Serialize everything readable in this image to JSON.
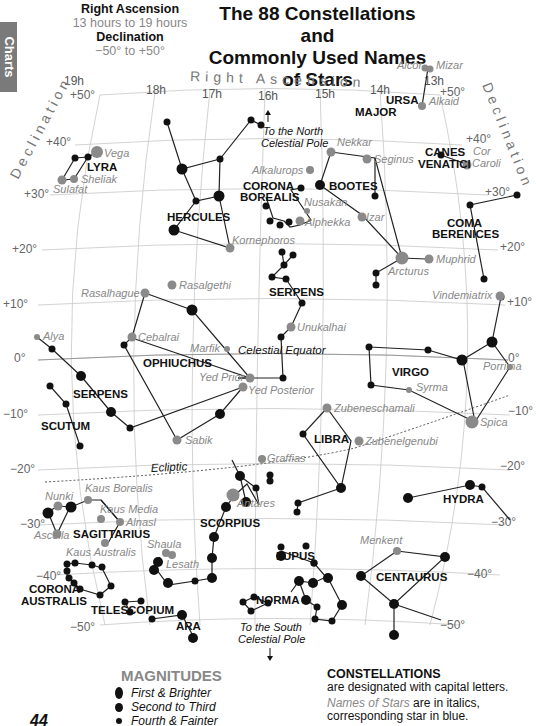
{
  "side_tab": {
    "label": "Charts"
  },
  "header": {
    "ra_title": "Right Ascension",
    "ra_range": "13 hours to 19 hours",
    "dec_title": "Declination",
    "dec_range": "−50° to +50°"
  },
  "title": {
    "line1": "The 88 Constellations and",
    "line2": "Commonly Used Names of Stars"
  },
  "axis": {
    "ra_label": "Right Ascension",
    "dec_label_left": "Declination",
    "dec_label_right": "Declination",
    "ra_ticks": [
      "19h",
      "18h",
      "17h",
      "16h",
      "15h",
      "14h",
      "13h"
    ],
    "dec_ticks_left": [
      "+50°",
      "+40°",
      "+30°",
      "+20°",
      "+10°",
      "0°",
      "−10°",
      "−20°",
      "−30°",
      "−40°",
      "−50°"
    ],
    "dec_ticks_right": [
      "+50°",
      "+40°",
      "+30°",
      "+20°",
      "+10°",
      "0°",
      "−10°",
      "−20°",
      "−30°",
      "−40°",
      "−50°"
    ]
  },
  "annotations": {
    "north_pole_1": "To the North",
    "north_pole_2": "Celestial Pole",
    "south_pole_1": "To the South",
    "south_pole_2": "Celestial Pole",
    "celestial_equator": "Celestial  Equator",
    "ecliptic": "Ecliptic"
  },
  "constellations": [
    {
      "name": "LYRA"
    },
    {
      "name": "HERCULES"
    },
    {
      "name": "CORONA"
    },
    {
      "name": "BOREALIS"
    },
    {
      "name": "BOOTES"
    },
    {
      "name": "URSA"
    },
    {
      "name": "MAJOR"
    },
    {
      "name": "CANES"
    },
    {
      "name": "VENATICI"
    },
    {
      "name": "COMA"
    },
    {
      "name": "BERENICES"
    },
    {
      "name": "SERPENS"
    },
    {
      "name": "OPHIUCHUS"
    },
    {
      "name": "SERPENS"
    },
    {
      "name": "SCUTUM"
    },
    {
      "name": "VIRGO"
    },
    {
      "name": "LIBRA"
    },
    {
      "name": "SAGITTARIUS"
    },
    {
      "name": "SCORPIUS"
    },
    {
      "name": "HYDRA"
    },
    {
      "name": "LUPUS"
    },
    {
      "name": "CENTAURUS"
    },
    {
      "name": "NORMA"
    },
    {
      "name": "CORONA"
    },
    {
      "name": "AUSTRALIS"
    },
    {
      "name": "TELESCOPIUM"
    },
    {
      "name": "ARA"
    }
  ],
  "stars": [
    {
      "name": "Vega"
    },
    {
      "name": "Sheliak"
    },
    {
      "name": "Sulafat"
    },
    {
      "name": "Alcor"
    },
    {
      "name": "Mizar"
    },
    {
      "name": "Alkaid"
    },
    {
      "name": "Nekkar"
    },
    {
      "name": "Seginus"
    },
    {
      "name": "Cor"
    },
    {
      "name": "Caroli"
    },
    {
      "name": "Alkalurops"
    },
    {
      "name": "Nusakan"
    },
    {
      "name": "Alphekka"
    },
    {
      "name": "Izar"
    },
    {
      "name": "Kornephoros"
    },
    {
      "name": "Arcturus"
    },
    {
      "name": "Muphrid"
    },
    {
      "name": "Rasalgethi"
    },
    {
      "name": "Rasalhague"
    },
    {
      "name": "Vindemiatrix"
    },
    {
      "name": "Unukalhai"
    },
    {
      "name": "Alya"
    },
    {
      "name": "Cebalrai"
    },
    {
      "name": "Marfik"
    },
    {
      "name": "Yed Prior"
    },
    {
      "name": "Yed Posterior"
    },
    {
      "name": "Porrima"
    },
    {
      "name": "Syrma"
    },
    {
      "name": "Zubeneschamali"
    },
    {
      "name": "Spica"
    },
    {
      "name": "Zubenelgenubi"
    },
    {
      "name": "Sabik"
    },
    {
      "name": "Graffias"
    },
    {
      "name": "Nunki"
    },
    {
      "name": "Kaus Borealis"
    },
    {
      "name": "Kaus Media"
    },
    {
      "name": "Alnasl"
    },
    {
      "name": "Ascella"
    },
    {
      "name": "Antares"
    },
    {
      "name": "Shaula"
    },
    {
      "name": "Lesath"
    },
    {
      "name": "Kaus Australis"
    },
    {
      "name": "Menkent"
    }
  ],
  "legend": {
    "magnitudes_title": "MAGNITUDES",
    "magnitudes": [
      {
        "label": "First & Brighter",
        "size": 10
      },
      {
        "label": "Second to Third",
        "size": 8
      },
      {
        "label": "Fourth & Fainter",
        "size": 6
      }
    ],
    "constellations_title": "CONSTELLATIONS",
    "constellations_text": "are designated with capital letters.",
    "stars_italic": "Names of Stars",
    "stars_text": " are in italics,",
    "stars_text2": "corresponding star in blue."
  },
  "page_number": "44",
  "colors": {
    "star_black": "#111111",
    "star_named": "#8a8a8a",
    "grid": "#c8c8c8",
    "label_gray": "#888888"
  }
}
